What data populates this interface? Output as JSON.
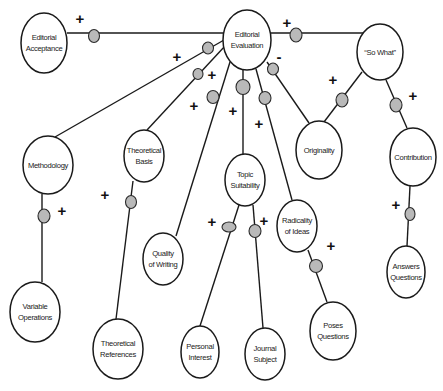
{
  "diagram": {
    "title": "",
    "caption": "",
    "colors": {
      "line": "#1a1a1a",
      "node_fill": "#ffffff",
      "connector_fill": "#b9b9b9",
      "background": "#ffffff"
    },
    "nodes": [
      {
        "id": "editorial-acceptance",
        "label_lines": [
          "Editorial",
          "Acceptance"
        ]
      },
      {
        "id": "editorial-evaluation",
        "label_lines": [
          "Editorial",
          "Evaluation"
        ]
      },
      {
        "id": "so-what",
        "label_lines": [
          "“So What”"
        ]
      },
      {
        "id": "methodology",
        "label_lines": [
          "Methodology"
        ]
      },
      {
        "id": "theoretical-basis",
        "label_lines": [
          "Theoretical",
          "Basis"
        ]
      },
      {
        "id": "topic-suitability",
        "label_lines": [
          "Topic",
          "Suitability"
        ]
      },
      {
        "id": "originality",
        "label_lines": [
          "Originality"
        ]
      },
      {
        "id": "contribution",
        "label_lines": [
          "Contribution"
        ]
      },
      {
        "id": "quality-of-writing",
        "label_lines": [
          "Quality",
          "of Writing"
        ]
      },
      {
        "id": "radicality-of-ideas",
        "label_lines": [
          "Radicality",
          "of Ideas"
        ]
      },
      {
        "id": "variable-operations",
        "label_lines": [
          "Variable",
          "Operations"
        ]
      },
      {
        "id": "theoretical-references",
        "label_lines": [
          "Theoretical",
          "References"
        ]
      },
      {
        "id": "personal-interest",
        "label_lines": [
          "Personal",
          "Interest"
        ]
      },
      {
        "id": "journal-subject",
        "label_lines": [
          "Journal",
          "Subject"
        ]
      },
      {
        "id": "poses-questions",
        "label_lines": [
          "Poses",
          "Questions"
        ]
      },
      {
        "id": "answers-questions",
        "label_lines": [
          "Answers",
          "Questions"
        ]
      }
    ],
    "edges": [
      {
        "from": "editorial-evaluation",
        "to": "editorial-acceptance",
        "sign": "+"
      },
      {
        "from": "editorial-evaluation",
        "to": "so-what",
        "sign": "+"
      },
      {
        "from": "editorial-evaluation",
        "to": "methodology",
        "sign": "+"
      },
      {
        "from": "editorial-evaluation",
        "to": "theoretical-basis",
        "sign": "+"
      },
      {
        "from": "editorial-evaluation",
        "to": "quality-of-writing",
        "sign": "+"
      },
      {
        "from": "editorial-evaluation",
        "to": "topic-suitability",
        "sign": "+"
      },
      {
        "from": "editorial-evaluation",
        "to": "radicality-of-ideas",
        "sign": "+"
      },
      {
        "from": "editorial-evaluation",
        "to": "originality",
        "sign": "-"
      },
      {
        "from": "so-what",
        "to": "originality",
        "sign": "+"
      },
      {
        "from": "so-what",
        "to": "contribution",
        "sign": "+"
      },
      {
        "from": "methodology",
        "to": "variable-operations",
        "sign": "+"
      },
      {
        "from": "theoretical-basis",
        "to": "theoretical-references",
        "sign": "+"
      },
      {
        "from": "topic-suitability",
        "to": "personal-interest",
        "sign": "+"
      },
      {
        "from": "topic-suitability",
        "to": "journal-subject",
        "sign": "+"
      },
      {
        "from": "radicality-of-ideas",
        "to": "poses-questions",
        "sign": "+"
      },
      {
        "from": "contribution",
        "to": "answers-questions",
        "sign": "+"
      }
    ]
  }
}
